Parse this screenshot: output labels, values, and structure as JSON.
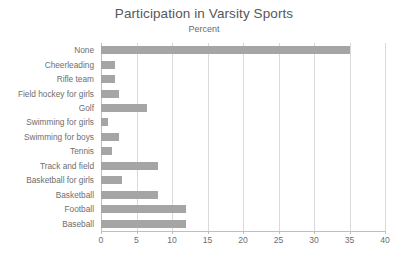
{
  "chart_data": {
    "type": "bar",
    "orientation": "horizontal",
    "title": "Participation in Varsity Sports",
    "subtitle": "Percent",
    "xlabel": "",
    "ylabel": "",
    "xlim": [
      0,
      40
    ],
    "xticks": [
      0,
      5,
      10,
      15,
      20,
      25,
      30,
      35,
      40
    ],
    "grid": "vertical",
    "legend": "none",
    "bar_color": "#a5a5a5",
    "categories": [
      "None",
      "Cheerleading",
      "Rifle team",
      "Field hockey for girls",
      "Golf",
      "Swimming for girls",
      "Swimming for boys",
      "Tennis",
      "Track and field",
      "Basketball for girls",
      "Basketball",
      "Football",
      "Baseball"
    ],
    "values": [
      35,
      2,
      2,
      2.5,
      6.5,
      1,
      2.5,
      1.5,
      8,
      3,
      8,
      12,
      12
    ]
  }
}
